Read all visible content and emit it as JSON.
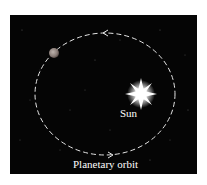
{
  "diagram": {
    "type": "orbit-illustration",
    "labels": {
      "sun": "Sun",
      "orbit": "Planetary orbit"
    },
    "colors": {
      "background": "#050505",
      "orbit": "#e6e6e6",
      "sun": "#ffffff",
      "planet": "#8a7d78",
      "text": "#ffffff"
    },
    "elements": [
      {
        "name": "sun",
        "cx": 141,
        "cy": 94
      },
      {
        "name": "planet",
        "cx": 54,
        "cy": 53,
        "r": 5
      },
      {
        "name": "orbit",
        "cx": 105,
        "cy": 94,
        "rx": 70,
        "ry": 61,
        "style": "dashed"
      }
    ],
    "arrows": [
      {
        "position": "top",
        "direction": "left"
      },
      {
        "position": "bottom",
        "direction": "right"
      }
    ]
  }
}
